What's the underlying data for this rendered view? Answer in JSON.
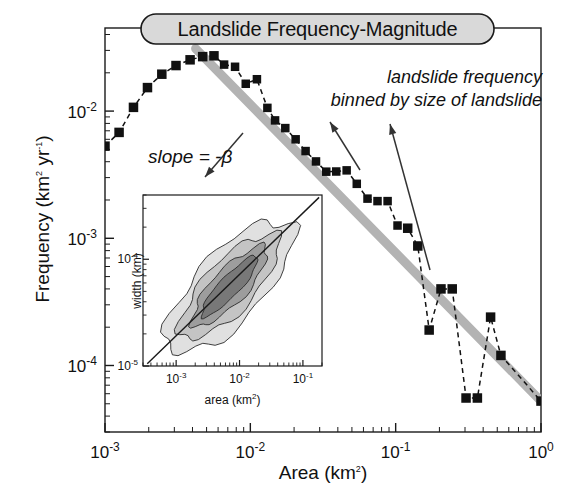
{
  "title": {
    "text": "Landslide Frequency-Magnitude",
    "banner_fill": "#d9d9d9",
    "banner_stroke": "#1a1a1a"
  },
  "axes": {
    "x": {
      "label_base": "Area (km",
      "label_sup": "2",
      "label_close": ")",
      "label_full": "Area (km2)",
      "ticks": [
        {
          "mant": "10",
          "exp": "-3",
          "value": 0.001
        },
        {
          "mant": "10",
          "exp": "-2",
          "value": 0.01
        },
        {
          "mant": "10",
          "exp": "-1",
          "value": 0.1
        },
        {
          "mant": "10",
          "exp": "0",
          "value": 1.0
        }
      ],
      "range": [
        0.001,
        1.0
      ],
      "scale": "log"
    },
    "y": {
      "label_part1": "Frequency (km",
      "label_sup1": "2",
      "label_part2": " yr",
      "label_sup2": "-1",
      "label_close": ")",
      "label_full": "Frequency (km2 yr-1)",
      "ticks": [
        {
          "mant": "10",
          "exp": "-2",
          "value": 0.01
        },
        {
          "mant": "10",
          "exp": "-3",
          "value": 0.001
        },
        {
          "mant": "10",
          "exp": "-4",
          "value": 0.0001
        }
      ],
      "range": [
        3e-05,
        0.045
      ],
      "scale": "log"
    }
  },
  "annotations": [
    {
      "name": "slope-annotation",
      "text": "slope = -β",
      "style": "italic",
      "x": 148,
      "y": 158,
      "arrow": {
        "x1": 243,
        "y1": 133,
        "x2": 205,
        "y2": 177
      }
    },
    {
      "name": "binned-frequency-annotation-line1",
      "text": "landslide frequency",
      "style": "italic",
      "x": 313,
      "y": 85
    },
    {
      "name": "binned-frequency-annotation-line2",
      "text": "binned by size of landslide",
      "style": "italic",
      "x": 283,
      "y": 109
    }
  ],
  "annotation_arrows": [
    {
      "name": "arrow-to-curve-mid",
      "x1": 360,
      "y1": 170,
      "x2": 330,
      "y2": 122
    },
    {
      "name": "arrow-to-curve-right",
      "x1": 430,
      "y1": 270,
      "x2": 390,
      "y2": 124
    }
  ],
  "trendline": {
    "name": "power-law-fit",
    "color": "#b3b3b3",
    "width": 9,
    "x1": 0.0042,
    "y1": 0.031,
    "x2": 1.0,
    "y2": 5.25e-05,
    "slope_label": "-β"
  },
  "chart_data": {
    "type": "line",
    "title": "Landslide Frequency-Magnitude",
    "xlabel": "Area (km2)",
    "ylabel": "Frequency (km2 yr-1)",
    "xscale": "log",
    "yscale": "log",
    "xlim": [
      0.001,
      1.0
    ],
    "ylim": [
      3e-05,
      0.045
    ],
    "grid": false,
    "legend": "none",
    "marker": "filled-square",
    "linestyle": "dashed",
    "series": [
      {
        "name": "landslide frequency binned by size of landslide",
        "x": [
          0.001,
          0.00125,
          0.00157,
          0.00196,
          0.00246,
          0.00308,
          0.00385,
          0.0047,
          0.00562,
          0.0066,
          0.00785,
          0.0093,
          0.0111,
          0.0131,
          0.0148,
          0.0174,
          0.0205,
          0.024,
          0.0283,
          0.0333,
          0.039,
          0.046,
          0.054,
          0.064,
          0.075,
          0.088,
          0.103,
          0.121,
          0.142,
          0.17,
          0.205,
          0.245,
          0.305,
          0.365,
          0.45,
          0.53,
          1.0
        ],
        "y": [
          0.0053,
          0.0068,
          0.0107,
          0.0153,
          0.0195,
          0.0228,
          0.0253,
          0.0268,
          0.0272,
          0.0232,
          0.0223,
          0.0164,
          0.0178,
          0.0106,
          0.00845,
          0.00735,
          0.006,
          0.00485,
          0.00402,
          0.00334,
          0.00335,
          0.00342,
          0.00268,
          0.00205,
          0.00196,
          0.00196,
          0.00126,
          0.0012,
          0.00087,
          0.00019,
          0.0004,
          0.0004,
          5.55e-05,
          5.55e-05,
          0.00024,
          0.00012,
          5.25e-05
        ]
      }
    ],
    "fit": {
      "name": "power-law trend",
      "type": "line",
      "x": [
        0.0042,
        1.0
      ],
      "y": [
        0.031,
        5.25e-05
      ],
      "color": "#b3b3b3",
      "note": "slope = -beta"
    }
  },
  "inset": {
    "name": "width-vs-area-inset",
    "xlabel_base": "area (km",
    "xlabel_sup": "2",
    "xlabel_close": ")",
    "xlabel_full": "area (km2)",
    "ylabel": "width (km)",
    "xticks": [
      {
        "mant": "10",
        "exp": "-3",
        "value": 0.001
      },
      {
        "mant": "10",
        "exp": "-2",
        "value": 0.01
      },
      {
        "mant": "10",
        "exp": "-1",
        "value": 0.1
      }
    ],
    "yticks": [
      {
        "mant": "10",
        "exp": "-4",
        "value": 0.0001
      },
      {
        "mant": "10",
        "exp": "-5",
        "value": 1e-05
      }
    ],
    "chart_data": {
      "type": "contour",
      "xscale": "log",
      "yscale": "log",
      "xlim": [
        0.0003,
        0.2
      ],
      "ylim": [
        1e-05,
        0.0004
      ],
      "levels": 4,
      "level_fills": [
        "#e0e0e0",
        "#c4c4c4",
        "#9d9d9d",
        "#787878"
      ],
      "trend": {
        "type": "line",
        "x": [
          0.00035,
          0.18
        ],
        "y": [
          1.05e-05,
          0.00038
        ]
      }
    }
  }
}
